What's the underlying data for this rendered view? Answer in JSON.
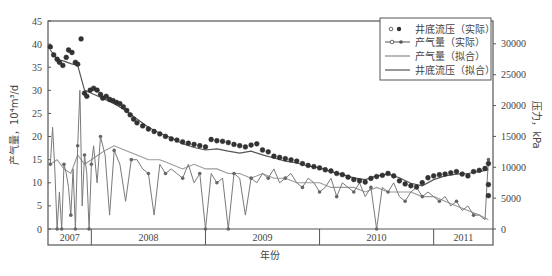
{
  "chart_data": {
    "type": "line",
    "title": "",
    "xlabel": "年份",
    "ylabel": "产气量，10⁴m³/d",
    "y2label": "压力，kPa",
    "xlim": [
      2007.62,
      2011.52
    ],
    "ylim": [
      0,
      45
    ],
    "y2lim": [
      0,
      33700
    ],
    "yticks": [
      0,
      5,
      10,
      15,
      20,
      25,
      30,
      35,
      40,
      45
    ],
    "y2ticks": [
      0,
      5000,
      10000,
      15000,
      20000,
      25000,
      30000
    ],
    "x_year_bands": [
      {
        "label": "2007",
        "from": 2007.62,
        "to": 2008.0
      },
      {
        "label": "2008",
        "from": 2008.0,
        "to": 2009.0
      },
      {
        "label": "2009",
        "from": 2009.0,
        "to": 2010.0
      },
      {
        "label": "2010",
        "from": 2010.0,
        "to": 2011.0
      },
      {
        "label": "2011",
        "from": 2011.0,
        "to": 2011.52
      }
    ],
    "grid": false,
    "legend_position": "upper right",
    "legend": [
      {
        "label": "井底流压（实际）",
        "style": "markers",
        "axis": "right"
      },
      {
        "label": "产气量（实际）",
        "style": "line-markers",
        "axis": "left"
      },
      {
        "label": "产气量（拟合）",
        "style": "line",
        "axis": "left"
      },
      {
        "label": "井底流压（拟合）",
        "style": "line",
        "axis": "right"
      }
    ],
    "series": [
      {
        "name": "井底流压（实际）",
        "axis": "right",
        "unit": "kPa",
        "x": [
          2007.64,
          2007.67,
          2007.7,
          2007.72,
          2007.75,
          2007.78,
          2007.8,
          2007.83,
          2007.86,
          2007.88,
          2007.91,
          2007.94,
          2007.96,
          2007.99,
          2008.02,
          2008.05,
          2008.08,
          2008.1,
          2008.13,
          2008.16,
          2008.19,
          2008.22,
          2008.25,
          2008.28,
          2008.31,
          2008.34,
          2008.37,
          2008.4,
          2008.45,
          2008.5,
          2008.55,
          2008.6,
          2008.65,
          2008.7,
          2008.75,
          2008.8,
          2008.85,
          2008.9,
          2008.95,
          2009.0,
          2009.05,
          2009.1,
          2009.15,
          2009.2,
          2009.25,
          2009.3,
          2009.35,
          2009.4,
          2009.45,
          2009.5,
          2009.55,
          2009.6,
          2009.65,
          2009.7,
          2009.75,
          2009.8,
          2009.85,
          2009.9,
          2009.95,
          2010.0,
          2010.05,
          2010.1,
          2010.15,
          2010.2,
          2010.25,
          2010.3,
          2010.35,
          2010.4,
          2010.45,
          2010.5,
          2010.55,
          2010.6,
          2010.65,
          2010.7,
          2010.75,
          2010.8,
          2010.85,
          2010.9,
          2010.95,
          2011.0,
          2011.05,
          2011.1,
          2011.15,
          2011.2,
          2011.25,
          2011.3,
          2011.35,
          2011.4,
          2011.45,
          2011.48,
          2011.48,
          2011.48
        ],
        "values": [
          29500,
          28200,
          27500,
          27000,
          26500,
          27800,
          29000,
          28600,
          27000,
          26700,
          30800,
          22000,
          21500,
          22500,
          22800,
          22500,
          21800,
          21200,
          21500,
          21000,
          20800,
          20500,
          20300,
          19800,
          19200,
          18500,
          17800,
          17200,
          16700,
          16200,
          15800,
          15400,
          15000,
          14600,
          14400,
          14100,
          13900,
          13700,
          13500,
          13300,
          14500,
          14300,
          14200,
          14000,
          13700,
          13500,
          13300,
          13600,
          13800,
          12800,
          12500,
          11800,
          11600,
          11400,
          11200,
          11000,
          10600,
          10300,
          10100,
          9900,
          9600,
          9400,
          9000,
          8800,
          8400,
          8000,
          7800,
          7600,
          8200,
          8500,
          8700,
          9000,
          8600,
          7800,
          7300,
          7000,
          6800,
          7500,
          8300,
          8600,
          8800,
          8900,
          9100,
          9300,
          8900,
          8600,
          9300,
          9500,
          9800,
          10600,
          7200,
          5400
        ]
      },
      {
        "name": "产气量（实际）",
        "axis": "left",
        "unit": "10^4 m3/d",
        "x": [
          2007.64,
          2007.66,
          2007.68,
          2007.7,
          2007.72,
          2007.74,
          2007.76,
          2007.78,
          2007.8,
          2007.82,
          2007.84,
          2007.86,
          2007.88,
          2007.9,
          2007.92,
          2007.94,
          2007.96,
          2007.98,
          2008.0,
          2008.02,
          2008.05,
          2008.08,
          2008.12,
          2008.16,
          2008.2,
          2008.25,
          2008.3,
          2008.35,
          2008.4,
          2008.45,
          2008.5,
          2008.55,
          2008.6,
          2008.65,
          2008.7,
          2008.75,
          2008.8,
          2008.85,
          2008.9,
          2008.95,
          2009.0,
          2009.05,
          2009.1,
          2009.15,
          2009.2,
          2009.25,
          2009.3,
          2009.35,
          2009.4,
          2009.45,
          2009.5,
          2009.55,
          2009.6,
          2009.65,
          2009.7,
          2009.75,
          2009.8,
          2009.85,
          2009.9,
          2009.95,
          2010.0,
          2010.05,
          2010.1,
          2010.15,
          2010.2,
          2010.25,
          2010.3,
          2010.35,
          2010.4,
          2010.45,
          2010.5,
          2010.55,
          2010.6,
          2010.65,
          2010.7,
          2010.75,
          2010.8,
          2010.85,
          2010.9,
          2010.95,
          2011.0,
          2011.05,
          2011.1,
          2011.15,
          2011.2,
          2011.25,
          2011.3,
          2011.35,
          2011.4,
          2011.45,
          2011.48
        ],
        "values": [
          14,
          22,
          13,
          0,
          8,
          0,
          14,
          12,
          9,
          3,
          13,
          0,
          18,
          30,
          5,
          16,
          12,
          0,
          14,
          18,
          10,
          20,
          16,
          3,
          17,
          14,
          6,
          15,
          15,
          13,
          12,
          3,
          14,
          12,
          13,
          12,
          11,
          14,
          10,
          12,
          0,
          12,
          10,
          11,
          0,
          12,
          11,
          3,
          11,
          10,
          12,
          11,
          13,
          10,
          11,
          12,
          10,
          9,
          11,
          10,
          8,
          9,
          11,
          7,
          10,
          9,
          8,
          10,
          7,
          9,
          0,
          9,
          8,
          10,
          7,
          6,
          8,
          9,
          7,
          8,
          7,
          6,
          7,
          5,
          6,
          4,
          5,
          3,
          3,
          2,
          15
        ]
      },
      {
        "name": "产气量（拟合）",
        "axis": "left",
        "unit": "10^4 m3/d",
        "x": [
          2007.64,
          2007.7,
          2007.76,
          2007.82,
          2007.88,
          2007.94,
          2008.0,
          2008.06,
          2008.12,
          2008.2,
          2008.3,
          2008.4,
          2008.5,
          2008.6,
          2008.7,
          2008.8,
          2008.9,
          2009.0,
          2009.1,
          2009.2,
          2009.3,
          2009.4,
          2009.5,
          2009.6,
          2009.7,
          2009.8,
          2009.9,
          2010.0,
          2010.1,
          2010.2,
          2010.3,
          2010.4,
          2010.5,
          2010.6,
          2010.7,
          2010.8,
          2010.9,
          2011.0,
          2011.1,
          2011.2,
          2011.3,
          2011.4,
          2011.48
        ],
        "values": [
          14,
          15,
          13,
          12,
          16,
          14,
          15,
          16,
          17,
          18,
          17,
          16,
          15,
          15,
          14,
          13,
          14,
          13,
          13,
          12,
          12,
          11,
          12,
          11,
          11,
          10,
          10,
          10,
          9,
          9,
          9,
          8,
          9,
          8,
          8,
          8,
          7,
          7,
          6,
          5,
          4,
          3,
          2
        ]
      },
      {
        "name": "井底流压（拟合）",
        "axis": "right",
        "unit": "kPa",
        "x": [
          2007.64,
          2007.7,
          2007.76,
          2007.82,
          2007.88,
          2007.94,
          2008.0,
          2008.06,
          2008.12,
          2008.2,
          2008.3,
          2008.4,
          2008.5,
          2008.6,
          2008.7,
          2008.8,
          2008.9,
          2009.0,
          2009.1,
          2009.2,
          2009.3,
          2009.4,
          2009.5,
          2009.6,
          2009.7,
          2009.8,
          2009.9,
          2010.0,
          2010.1,
          2010.2,
          2010.3,
          2010.4,
          2010.5,
          2010.6,
          2010.7,
          2010.8,
          2010.9,
          2011.0,
          2011.1,
          2011.2,
          2011.3,
          2011.4,
          2011.48
        ],
        "values": [
          29000,
          27500,
          27200,
          26800,
          26500,
          22500,
          22000,
          21500,
          21000,
          20300,
          19200,
          17800,
          16500,
          15500,
          14800,
          13800,
          13200,
          12800,
          13000,
          12600,
          12300,
          12600,
          12000,
          11500,
          11000,
          10700,
          10200,
          9900,
          9300,
          8800,
          8300,
          8000,
          8600,
          8900,
          8300,
          7400,
          7000,
          8000,
          8600,
          8900,
          9000,
          9300,
          9600
        ]
      }
    ]
  }
}
